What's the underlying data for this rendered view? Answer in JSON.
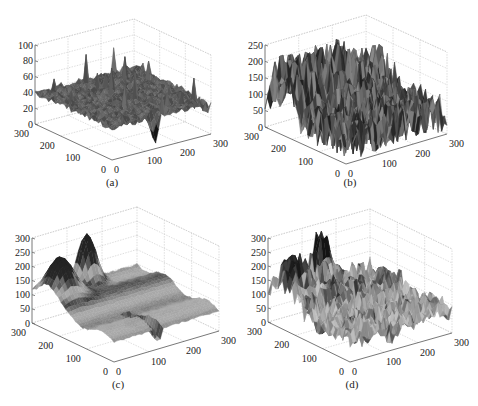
{
  "figure": {
    "layout": "2x2 grid of 3D surface plots",
    "panels": [
      "a",
      "b",
      "c",
      "d"
    ]
  },
  "chart_data": [
    {
      "id": "a",
      "type": "surface3d",
      "caption": "(a)",
      "xlabel": "",
      "ylabel": "",
      "zlabel": "",
      "x_ticks": [
        "0",
        "100",
        "200",
        "300"
      ],
      "y_ticks": [
        "0",
        "100",
        "200",
        "300"
      ],
      "z_ticks": [
        "0",
        "20",
        "40",
        "60",
        "80",
        "100"
      ],
      "xlim": [
        0,
        300
      ],
      "ylim": [
        0,
        300
      ],
      "zlim": [
        0,
        100
      ],
      "grid": true,
      "view": {
        "azimuth": -37.5,
        "elevation": 30
      },
      "surface": {
        "base_level": 40,
        "noise": 4,
        "spike_max": 75,
        "description": "mostly flat noisy plane near z≈40 with sparse spikes up to ~75 and a dip to ~0 near x≈130, y≈0"
      },
      "colormap": "grayscale"
    },
    {
      "id": "b",
      "type": "surface3d",
      "caption": "(b)",
      "xlabel": "",
      "ylabel": "",
      "zlabel": "",
      "x_ticks": [
        "0",
        "100",
        "200",
        "300"
      ],
      "y_ticks": [
        "0",
        "100",
        "200",
        "300"
      ],
      "z_ticks": [
        "0",
        "50",
        "100",
        "150",
        "200",
        "250"
      ],
      "xlim": [
        0,
        300
      ],
      "ylim": [
        0,
        300
      ],
      "zlim": [
        0,
        250
      ],
      "grid": true,
      "view": {
        "azimuth": -37.5,
        "elevation": 30
      },
      "surface": {
        "base_level": 90,
        "noise": 60,
        "peak": 220,
        "description": "highly noisy surface, values ~0–220, ridge near y≈250 up to ~220"
      },
      "colormap": "grayscale"
    },
    {
      "id": "c",
      "type": "surface3d",
      "caption": "(c)",
      "xlabel": "",
      "ylabel": "",
      "zlabel": "",
      "x_ticks": [
        "0",
        "100",
        "200",
        "300"
      ],
      "y_ticks": [
        "0",
        "100",
        "200",
        "300"
      ],
      "z_ticks": [
        "0",
        "50",
        "100",
        "150",
        "200",
        "250",
        "300"
      ],
      "xlim": [
        0,
        300
      ],
      "ylim": [
        0,
        300
      ],
      "zlim": [
        0,
        300
      ],
      "grid": true,
      "view": {
        "azimuth": -37.5,
        "elevation": 30
      },
      "surface": {
        "base_level": 100,
        "noise": 8,
        "peak": 270,
        "description": "smooth banded surface with two dark peaks (~240 and ~270) at the back, values decreasing toward front"
      },
      "colormap": "grayscale"
    },
    {
      "id": "d",
      "type": "surface3d",
      "caption": "(d)",
      "xlabel": "",
      "ylabel": "",
      "zlabel": "",
      "x_ticks": [
        "0",
        "100",
        "200",
        "300"
      ],
      "y_ticks": [
        "0",
        "100",
        "200",
        "300"
      ],
      "z_ticks": [
        "0",
        "50",
        "100",
        "150",
        "200",
        "250",
        "300"
      ],
      "xlim": [
        0,
        300
      ],
      "ylim": [
        0,
        300
      ],
      "zlim": [
        0,
        300
      ],
      "grid": true,
      "view": {
        "azimuth": -37.5,
        "elevation": 30
      },
      "surface": {
        "base_level": 100,
        "noise": 35,
        "peak": 270,
        "description": "noisy version of (c): two dark peaks (~240, ~270) at back with rough texture"
      },
      "colormap": "grayscale"
    }
  ],
  "panels_geometry": [
    {
      "id": "a",
      "z_axis_x": 35,
      "z0_y": 124,
      "ztop_y": 45,
      "front": [
        112,
        160
      ],
      "right": [
        211,
        134
      ],
      "caption_pos": [
        112,
        183
      ],
      "seed": 11,
      "shape": "flat"
    },
    {
      "id": "b",
      "z_axis_x": 265,
      "z0_y": 127,
      "ztop_y": 45,
      "front": [
        346,
        164
      ],
      "right": [
        447,
        134
      ],
      "caption_pos": [
        350,
        183
      ],
      "seed": 23,
      "shape": "noisy"
    },
    {
      "id": "c",
      "z_axis_x": 32,
      "z0_y": 323,
      "ztop_y": 238,
      "front": [
        114,
        362
      ],
      "right": [
        219,
        331
      ],
      "caption_pos": [
        118,
        385
      ],
      "seed": 37,
      "shape": "smooth"
    },
    {
      "id": "d",
      "z_axis_x": 268,
      "z0_y": 322,
      "ztop_y": 238,
      "front": [
        350,
        362
      ],
      "right": [
        452,
        333
      ],
      "caption_pos": [
        352,
        385
      ],
      "seed": 41,
      "shape": "roughpeaks"
    }
  ]
}
